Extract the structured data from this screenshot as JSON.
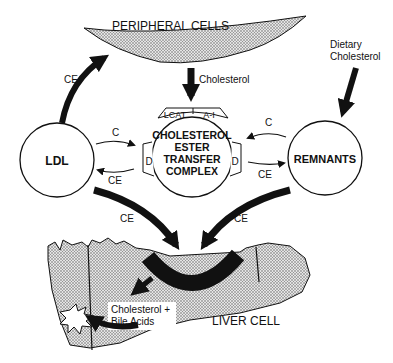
{
  "diagram": {
    "peripheral_cells": {
      "label": "PERIPHERAL CELLS"
    },
    "dietary": {
      "line1": "Dietary",
      "line2": "Cholesterol"
    },
    "cholesterol_arrow_label": "Cholesterol",
    "ldl": {
      "label": "LDL"
    },
    "remnants": {
      "label": "REMNANTS"
    },
    "complex": {
      "line1": "CHOLESTEROL",
      "line2": "ESTER",
      "line3": "TRANSFER",
      "line4": "COMPLEX",
      "cap_left": "LCAT",
      "cap_right": "A-I",
      "side_left": "D",
      "side_right": "D"
    },
    "arrows": {
      "ldl_to_peripheral": "CE",
      "ldl_to_complex": "C",
      "complex_to_ldl": "CE",
      "remnants_to_complex": "C",
      "complex_to_remnants": "CE",
      "ldl_to_liver": "CE",
      "remnants_to_liver": "CE"
    },
    "liver": {
      "label": "LIVER CELL",
      "product_line1": "Cholesterol +",
      "product_line2": "Bile Acids"
    },
    "colors": {
      "ink": "#111111",
      "stipple": "#b8b8b8",
      "paper": "#ffffff"
    }
  }
}
